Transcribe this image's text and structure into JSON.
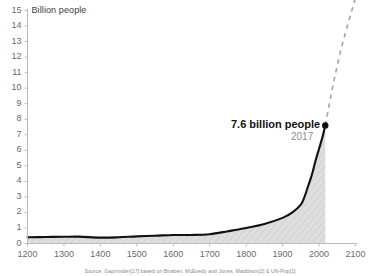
{
  "chart_data": {
    "type": "area",
    "title": "",
    "subtitle": "",
    "xlabel": "",
    "ylabel": "Billion people",
    "xlim": [
      1200,
      2100
    ],
    "ylim": [
      0,
      15
    ],
    "grid": false,
    "legend": "none",
    "x_ticks": [
      "1200",
      "1300",
      "1400",
      "1500",
      "1600",
      "1700",
      "1800",
      "1900",
      "2000",
      "2100"
    ],
    "y_ticks": [
      "0",
      "1",
      "2",
      "3",
      "4",
      "5",
      "6",
      "7",
      "8",
      "9",
      "10",
      "11",
      "12",
      "13",
      "14",
      "15"
    ],
    "series": [
      {
        "name": "World population (historical)",
        "style": "solid-black-line-with-hatched-fill",
        "x": [
          1200,
          1250,
          1300,
          1340,
          1400,
          1450,
          1500,
          1550,
          1600,
          1650,
          1700,
          1750,
          1800,
          1850,
          1900,
          1927,
          1950,
          1960,
          1970,
          1980,
          1990,
          2000,
          2010,
          2017
        ],
        "y": [
          0.4,
          0.42,
          0.43,
          0.44,
          0.38,
          0.4,
          0.46,
          0.5,
          0.55,
          0.55,
          0.6,
          0.79,
          1.0,
          1.26,
          1.65,
          2.0,
          2.5,
          3.0,
          3.7,
          4.4,
          5.3,
          6.1,
          6.9,
          7.6
        ]
      },
      {
        "name": "Projection",
        "style": "gray-dashed-line",
        "x": [
          2017,
          2040,
          2060,
          2080,
          2100
        ],
        "y": [
          7.6,
          10.4,
          12.5,
          14.2,
          15.8
        ]
      }
    ],
    "annotations": [
      {
        "label": "7.6 billion people",
        "sublabel": "2017",
        "x": 2017,
        "y": 7.6,
        "marker": "filled-circle"
      }
    ],
    "source": "Source: Gapminder[17] based on Biraben, McEvedy and Jones, Maddison[2] & UN-Pop[1]",
    "colors": {
      "line": "#111111",
      "fill": "#d9d9d9",
      "projection": "#a8a8a8",
      "axis": "#b9b9b9",
      "tick_text": "#6b6b6b",
      "annotation": "#121212",
      "annotation_sub": "#8e8e8e",
      "source_text": "#8a8a8a",
      "background": "#ffffff"
    }
  }
}
